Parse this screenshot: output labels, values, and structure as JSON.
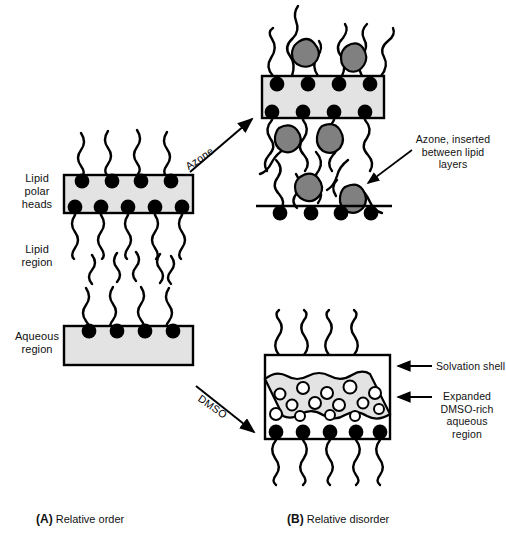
{
  "figure": {
    "left_labels": {
      "lipid_polar_heads": "Lipid\npolar\nheads",
      "lipid_region": "Lipid\nregion",
      "aqueous_region": "Aqueous\nregion"
    },
    "arrows": {
      "azone": "Azone",
      "dmso": "DMSO"
    },
    "annotations": {
      "azone_inserted": "Azone, inserted\nbetween lipid\nlayers",
      "solvation_shell": "Solvation shell",
      "expanded_dmso": "Expanded\nDMSO-rich\naqueous\nregion"
    },
    "captions": {
      "a_tag": "(A)",
      "a_text": " Relative order",
      "b_tag": "(B)",
      "b_text": " Relative disorder"
    },
    "colors": {
      "membrane_fill": "#e3e3e3",
      "azone_blob": "#808080",
      "head_group": "#000000",
      "outline": "#000000",
      "background": "#ffffff"
    }
  }
}
